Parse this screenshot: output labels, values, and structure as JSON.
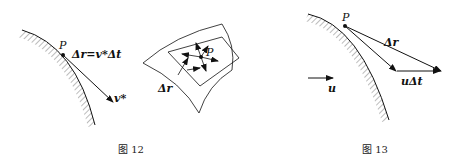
{
  "figures": [
    {
      "caption": "图 12",
      "labels": {
        "point": "P",
        "delta_r_eq": "Δr=v*Δt",
        "velocity": "v*",
        "delta_r": "Δr",
        "point2": "P"
      }
    },
    {
      "caption": "图 13",
      "labels": {
        "point": "P",
        "delta_r": "Δr",
        "u_delta_t": "uΔt",
        "flow": "u"
      }
    }
  ]
}
